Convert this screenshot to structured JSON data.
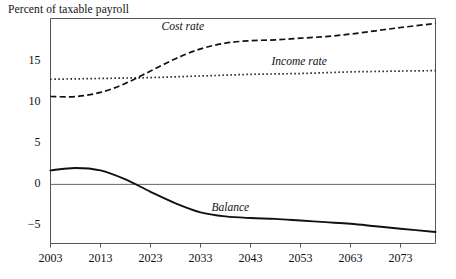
{
  "chart_data": {
    "type": "line",
    "title": "Percent of taxable payroll",
    "xlabel": "",
    "ylabel": "Percent of taxable payroll",
    "xlim": [
      2003,
      2080
    ],
    "ylim": [
      -7.2,
      20.2
    ],
    "grid": false,
    "legend_position": "inline-annotations",
    "zero_line": 0,
    "x_ticks": [
      2003,
      2013,
      2023,
      2033,
      2043,
      2053,
      2063,
      2073
    ],
    "x_tick_labels": [
      "2003",
      "2013",
      "2023",
      "2033",
      "2043",
      "2053",
      "2063",
      "2073"
    ],
    "y_ticks": [
      15,
      10,
      5,
      0,
      -5
    ],
    "y_tick_labels": [
      "15",
      "10",
      "5",
      "0",
      "−5"
    ],
    "series": [
      {
        "name": "Cost rate",
        "style": "dashed",
        "label_x": 2030,
        "label_y": 19.0,
        "x": [
          2003,
          2008,
          2013,
          2018,
          2023,
          2028,
          2033,
          2038,
          2043,
          2048,
          2053,
          2058,
          2063,
          2068,
          2073,
          2080
        ],
        "values": [
          10.7,
          10.7,
          11.2,
          12.3,
          13.8,
          15.3,
          16.5,
          17.2,
          17.5,
          17.6,
          17.8,
          18.0,
          18.3,
          18.7,
          19.1,
          19.6
        ]
      },
      {
        "name": "Income rate",
        "style": "dotted",
        "label_x": 2052,
        "label_y": 14.8,
        "x": [
          2003,
          2008,
          2013,
          2018,
          2023,
          2028,
          2033,
          2038,
          2043,
          2048,
          2053,
          2058,
          2063,
          2068,
          2073,
          2080
        ],
        "values": [
          12.8,
          12.85,
          12.9,
          12.95,
          13.0,
          13.1,
          13.2,
          13.3,
          13.4,
          13.45,
          13.5,
          13.6,
          13.7,
          13.75,
          13.8,
          13.85
        ]
      },
      {
        "name": "Balance",
        "style": "solid",
        "label_x": 2040,
        "label_y": -3.0,
        "x": [
          2003,
          2008,
          2013,
          2018,
          2023,
          2028,
          2033,
          2038,
          2043,
          2048,
          2053,
          2058,
          2063,
          2068,
          2073,
          2080
        ],
        "values": [
          1.7,
          2.0,
          1.7,
          0.6,
          -0.9,
          -2.3,
          -3.4,
          -3.9,
          -4.1,
          -4.2,
          -4.4,
          -4.6,
          -4.8,
          -5.1,
          -5.4,
          -5.8
        ]
      }
    ]
  }
}
